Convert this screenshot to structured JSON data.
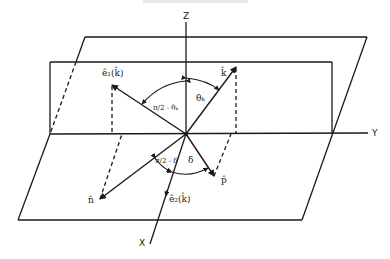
{
  "figure": {
    "header_text": "",
    "axes": {
      "x_label": "X",
      "y_label": "Y",
      "z_label": "Z"
    },
    "vectors": {
      "k_hat": "k̂",
      "e1": "ê₁(k̂)",
      "e2": "ê₂(k̂)",
      "n_hat": "n̂",
      "p_hat": "p̂"
    },
    "angles": {
      "theta_k": "θₖ",
      "pi2_minus_theta_k": "π/2 - θₖ",
      "pi2_minus_delta": "π/2 - δ",
      "delta": "δ"
    },
    "colors": {
      "ink": "#1a1a1a",
      "background": "#ffffff"
    }
  }
}
